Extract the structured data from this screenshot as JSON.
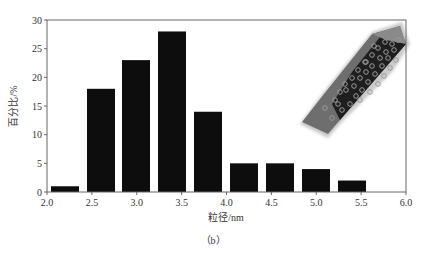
{
  "chart_data": {
    "type": "bar",
    "title": "",
    "xlabel": "粒径/nm",
    "ylabel": "百分比/%",
    "caption": "（b）",
    "bin_edges": [
      2.0,
      2.5,
      3.0,
      3.5,
      4.0,
      4.5,
      5.0,
      5.5
    ],
    "bars": [
      {
        "x": 2.2,
        "value": 1
      },
      {
        "x": 2.6,
        "value": 18
      },
      {
        "x": 3.0,
        "value": 23
      },
      {
        "x": 3.4,
        "value": 28
      },
      {
        "x": 3.8,
        "value": 14
      },
      {
        "x": 4.2,
        "value": 5
      },
      {
        "x": 4.6,
        "value": 5
      },
      {
        "x": 5.0,
        "value": 4
      },
      {
        "x": 5.4,
        "value": 2
      }
    ],
    "categories": [
      "2.2",
      "2.6",
      "3.0",
      "3.4",
      "3.8",
      "4.2",
      "4.6",
      "5.0",
      "5.4"
    ],
    "values": [
      1,
      18,
      23,
      28,
      14,
      5,
      5,
      4,
      2
    ],
    "xlim": [
      2.0,
      6.0
    ],
    "ylim": [
      0,
      30
    ],
    "xticks": [
      "2.0",
      "2.5",
      "3.0",
      "3.5",
      "4.0",
      "4.5",
      "5.0",
      "5.5",
      "6.0"
    ],
    "yticks": [
      "0",
      "5",
      "10",
      "15",
      "20",
      "25",
      "30"
    ],
    "grid": false,
    "legend": null,
    "inset": "3D rendering of elongated hexagonal prism nanoparticle with embedded spherical particles"
  },
  "colors": {
    "bar": "#0d0d0d",
    "axis": "#555555",
    "inset_body": "#6b6b6b",
    "inset_dark": "#1a1a1a"
  }
}
